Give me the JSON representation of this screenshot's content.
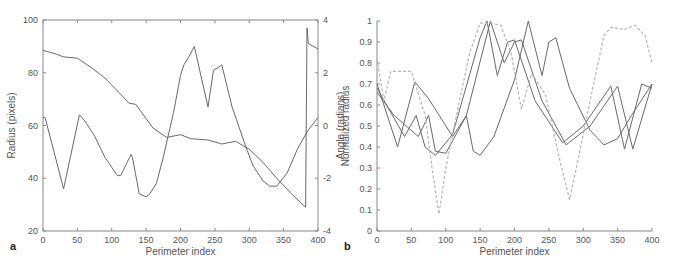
{
  "chart_data": [
    {
      "panel": "a",
      "type": "line",
      "xlabel": "Perimeter index",
      "ylabel": "Radius (pixels)",
      "y2label": "Angle (radians)",
      "xlim": [
        0,
        400
      ],
      "ylim": [
        20,
        100
      ],
      "y2lim": [
        -4,
        4
      ],
      "xticks": [
        0,
        50,
        100,
        150,
        200,
        250,
        300,
        350,
        400
      ],
      "yticks": [
        20,
        40,
        60,
        80,
        100
      ],
      "y2ticks": [
        -4,
        -2,
        0,
        2,
        4
      ],
      "grid": false,
      "box": true,
      "series": [
        {
          "name": "Radius",
          "axis": "left",
          "style": "solid",
          "x": [
            0,
            3,
            30,
            53,
            60,
            75,
            90,
            108,
            113,
            128,
            130,
            140,
            150,
            155,
            165,
            175,
            190,
            200,
            205,
            212,
            220,
            240,
            248,
            255,
            260,
            275,
            295,
            305,
            320,
            330,
            340,
            355,
            370,
            385,
            400
          ],
          "y": [
            63,
            63,
            36,
            64,
            62,
            56,
            48,
            41,
            41,
            49,
            48,
            34,
            33,
            34,
            38,
            48,
            65,
            79,
            83,
            86,
            90,
            67,
            81,
            82,
            83,
            67,
            52,
            45,
            39,
            37,
            37,
            42,
            51,
            58,
            63
          ]
        },
        {
          "name": "Angle",
          "axis": "right",
          "style": "solid",
          "x": [
            0,
            20,
            30,
            50,
            70,
            90,
            105,
            125,
            135,
            160,
            180,
            200,
            215,
            240,
            260,
            280,
            300,
            320,
            340,
            360,
            382,
            384,
            386,
            400
          ],
          "y": [
            2.85,
            2.7,
            2.6,
            2.55,
            2.2,
            1.8,
            1.4,
            0.85,
            0.8,
            -0.1,
            -0.45,
            -0.35,
            -0.5,
            -0.55,
            -0.7,
            -0.6,
            -0.9,
            -1.4,
            -2.0,
            -2.55,
            -3.1,
            3.7,
            3.1,
            2.9
          ]
        }
      ]
    },
    {
      "panel": "b",
      "type": "line",
      "xlabel": "Perimeter index",
      "ylabel": "Normalized radius",
      "xlim": [
        0,
        400
      ],
      "ylim": [
        0,
        1
      ],
      "xticks": [
        0,
        50,
        100,
        150,
        200,
        250,
        300,
        350,
        400
      ],
      "yticks": [
        0,
        0.1,
        0.2,
        0.3,
        0.4,
        0.5,
        0.6,
        0.7,
        0.8,
        0.9,
        1
      ],
      "ytick_labels": [
        "0",
        "0.1",
        "0.2",
        "0.3",
        "0.4",
        "0.5",
        "0.6",
        "0.7",
        "0.8",
        "0.9",
        "1"
      ],
      "grid": false,
      "box": false,
      "series": [
        {
          "name": "Curve 1",
          "style": "solid",
          "x": [
            0,
            30,
            55,
            75,
            110,
            130,
            140,
            150,
            170,
            200,
            220,
            240,
            250,
            260,
            280,
            310,
            330,
            350,
            370,
            400
          ],
          "y": [
            0.7,
            0.4,
            0.71,
            0.63,
            0.45,
            0.55,
            0.38,
            0.36,
            0.45,
            0.72,
            1.0,
            0.74,
            0.9,
            0.92,
            0.68,
            0.48,
            0.41,
            0.44,
            0.55,
            0.7
          ]
        },
        {
          "name": "Curve 2",
          "style": "solid",
          "x": [
            0,
            40,
            57,
            70,
            85,
            110,
            150,
            160,
            175,
            190,
            200,
            230,
            270,
            300,
            340,
            360,
            385,
            400
          ],
          "y": [
            0.68,
            0.45,
            0.55,
            0.4,
            0.36,
            0.46,
            0.92,
            1.0,
            0.74,
            0.9,
            0.91,
            0.62,
            0.42,
            0.5,
            0.69,
            0.39,
            0.7,
            0.68
          ]
        },
        {
          "name": "Curve 3",
          "style": "solid",
          "x": [
            0,
            25,
            60,
            75,
            85,
            100,
            130,
            165,
            185,
            200,
            210,
            240,
            275,
            310,
            350,
            372,
            400
          ],
          "y": [
            0.66,
            0.55,
            0.45,
            0.55,
            0.38,
            0.37,
            0.55,
            1.0,
            0.8,
            0.9,
            0.91,
            0.62,
            0.41,
            0.5,
            0.69,
            0.39,
            0.7
          ]
        },
        {
          "name": "Curve 4",
          "style": "dashed",
          "x": [
            0,
            10,
            20,
            50,
            70,
            80,
            90,
            100,
            120,
            135,
            150,
            165,
            180,
            195,
            210,
            225,
            245,
            265,
            280,
            290,
            310,
            330,
            340,
            360,
            375,
            390,
            400
          ],
          "y": [
            0.82,
            0.62,
            0.76,
            0.76,
            0.55,
            0.3,
            0.08,
            0.3,
            0.62,
            0.85,
            0.99,
            0.99,
            0.98,
            0.85,
            0.58,
            0.75,
            0.65,
            0.35,
            0.15,
            0.3,
            0.62,
            0.93,
            0.97,
            0.96,
            0.98,
            0.93,
            0.8
          ]
        }
      ]
    }
  ],
  "style": {
    "line_color": "#6a6a6a",
    "dashed_color": "#b5b5b5",
    "axis_color": "#888888"
  }
}
